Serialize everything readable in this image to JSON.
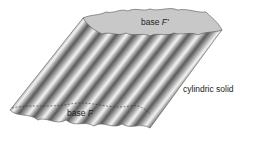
{
  "diagram": {
    "labels": {
      "top_base_prefix": "base ",
      "top_base_symbol": "F'",
      "bottom_base_prefix": "base ",
      "bottom_base_symbol": "F",
      "solid": "cylindric solid"
    },
    "colors": {
      "top_face": "#c8c8c8",
      "ridge_light": "#f4f4f4",
      "ridge_dark": "#6a6a6a",
      "outline": "#555555"
    }
  }
}
